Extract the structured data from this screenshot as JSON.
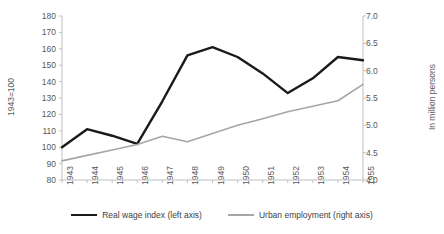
{
  "chart_data": {
    "type": "line",
    "title": "",
    "xlabel": "",
    "categories": [
      "1943",
      "1944",
      "1945",
      "1946",
      "1947",
      "1948",
      "1949",
      "1950",
      "1951",
      "1952",
      "1953",
      "1954",
      "1955"
    ],
    "grid": false,
    "legend_position": "bottom",
    "axes": {
      "left": {
        "label": "1943=100",
        "ylim": [
          80,
          180
        ],
        "tick_step": 10,
        "ticks": [
          "180",
          "170",
          "160",
          "150",
          "140",
          "130",
          "120",
          "110",
          "100",
          "90",
          "80"
        ]
      },
      "right": {
        "label": "In million persons",
        "ylim": [
          4.0,
          7.0
        ],
        "tick_step": 0.5,
        "ticks": [
          "7.0",
          "6.5",
          "6.0",
          "5.5",
          "5.0",
          "4.5",
          "4.0"
        ]
      }
    },
    "series": [
      {
        "name": "Real wage index (left axis)",
        "axis": "left",
        "color": "#1a1a1a",
        "values": [
          100,
          111,
          107,
          102,
          128,
          156,
          161,
          155,
          145,
          133,
          142,
          155,
          153
        ]
      },
      {
        "name": "Urban employment (right axis)",
        "axis": "right",
        "color": "#a6a6a6",
        "values": [
          4.35,
          4.45,
          4.55,
          4.65,
          4.8,
          4.7,
          4.85,
          5.0,
          5.12,
          5.25,
          5.35,
          5.45,
          5.75
        ]
      }
    ]
  },
  "legend": {
    "items": [
      {
        "label": "Real wage index (left axis)",
        "swatch": "series-wage"
      },
      {
        "label": "Urban employment (right axis)",
        "swatch": "series-emp"
      }
    ]
  }
}
